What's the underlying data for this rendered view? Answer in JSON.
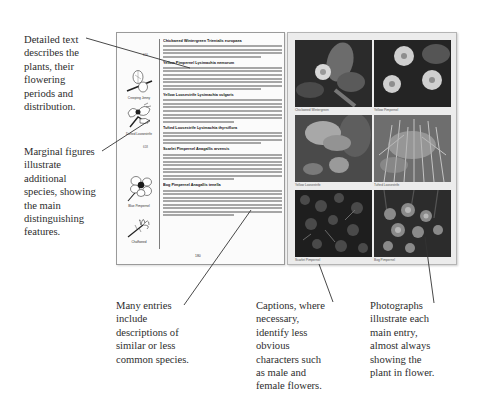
{
  "annotations": {
    "detailed_text": [
      "Detailed text",
      "describes the",
      "plants, their",
      "flowering",
      "periods and",
      "distribution."
    ],
    "marginal_figures": [
      "Marginal figures",
      "illustrate",
      "additional",
      "species, showing",
      "the main",
      "distinguishing",
      "features."
    ],
    "many_entries": [
      "Many entries",
      "include",
      "descriptions of",
      "similar or less",
      "common species."
    ],
    "captions": [
      "Captions, where",
      "necessary,",
      "identify less",
      "obvious",
      "characters such",
      "as male and",
      "female flowers."
    ],
    "photographs": [
      "Photographs",
      "illustrate each",
      "main entry,",
      "almost always",
      "showing the",
      "plant in flower."
    ]
  },
  "left_page": {
    "margin_numbers": [
      "616",
      "618"
    ],
    "figures": [
      {
        "caption": "Creeping Jenny",
        "icon": "leaf-sprig-icon"
      },
      {
        "caption": "Dotted Loosestrife",
        "icon": "flower-cluster-icon"
      },
      {
        "caption": "Blue Pimpernel",
        "icon": "five-petal-flower-icon"
      },
      {
        "caption": "Chaffweed",
        "icon": "small-sprig-icon"
      }
    ],
    "entries": [
      {
        "heading": "Chickweed Wintergreen Trientalis europaea",
        "lines": 5
      },
      {
        "heading": "Yellow Pimpernel Lysimachia nemorum",
        "lines": 8
      },
      {
        "heading": "Yellow Loosestrife Lysimachia vulgaris",
        "lines": 8
      },
      {
        "heading": "Tufted Loosestrife Lysimachia thyrsiflora",
        "lines": 5
      },
      {
        "heading": "Scarlet Pimpernel Anagallis arvensis",
        "lines": 9
      },
      {
        "heading": "Bog Pimpernel Anagallis tenella",
        "lines": 9
      }
    ],
    "page_number": "180"
  },
  "right_page": {
    "photos": [
      {
        "caption": "Chickweed Wintergreen",
        "tone": "#3a3a3a"
      },
      {
        "caption": "Yellow Pimpernel",
        "tone": "#2c2c2c"
      },
      {
        "caption": "Yellow Loosestrife",
        "tone": "#5a5a5a"
      },
      {
        "caption": "Tufted Loosestrife",
        "tone": "#8a8a8a"
      },
      {
        "caption": "Scarlet Pimpernel",
        "tone": "#222222"
      },
      {
        "caption": "Bog Pimpernel",
        "tone": "#3c3c3c"
      }
    ]
  }
}
